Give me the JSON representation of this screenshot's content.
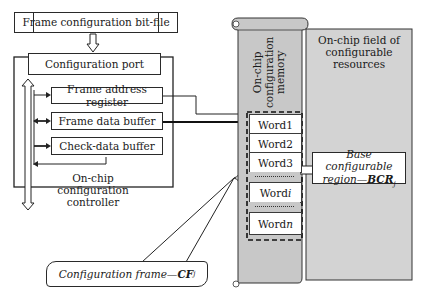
{
  "diagram": {
    "bitfile_label": "Frame configuration bit-file",
    "config_port_label": "Configuration port",
    "controller": {
      "registers": [
        "Frame address register",
        "Frame data buffer",
        "Check-data buffer"
      ],
      "label_line1": "On-chip configuration",
      "label_line2": "controller"
    },
    "memory": {
      "label_line1": "On-chip",
      "label_line2": "configuration",
      "label_line3": "memory",
      "words": [
        {
          "prefix": "Word ",
          "index": "1"
        },
        {
          "prefix": "Word ",
          "index": "2"
        },
        {
          "prefix": "Word ",
          "index": "3"
        },
        {
          "prefix": "Word ",
          "index": "i"
        },
        {
          "prefix": "Word ",
          "index": "n"
        }
      ]
    },
    "field": {
      "label_line1": "On-chip field of",
      "label_line2": "configurable",
      "label_line3": "resources"
    },
    "bcr": {
      "line1": "Base configurable",
      "line2_prefix": "region—",
      "line2_bold": "BCR",
      "line2_sub": "j"
    },
    "callout": {
      "prefix": "Configuration frame—",
      "bold": "CF",
      "sub": "j"
    },
    "colors": {
      "memory_fill": "#c8c8c8",
      "field_fill": "#d3d3d3",
      "line": "#1a1a1a"
    }
  }
}
